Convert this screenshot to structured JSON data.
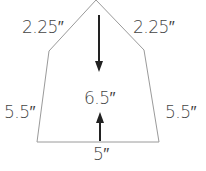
{
  "diagram": {
    "shape": "pentagon-house",
    "colors": {
      "outline": "#9a9a9a",
      "arrow": "#222222",
      "text": "#444444"
    },
    "labels": {
      "roof_left": "2.25″",
      "roof_right": "2.25″",
      "height": "6.5″",
      "side_left": "5.5″",
      "side_right": "5.5″",
      "base": "5″"
    }
  }
}
